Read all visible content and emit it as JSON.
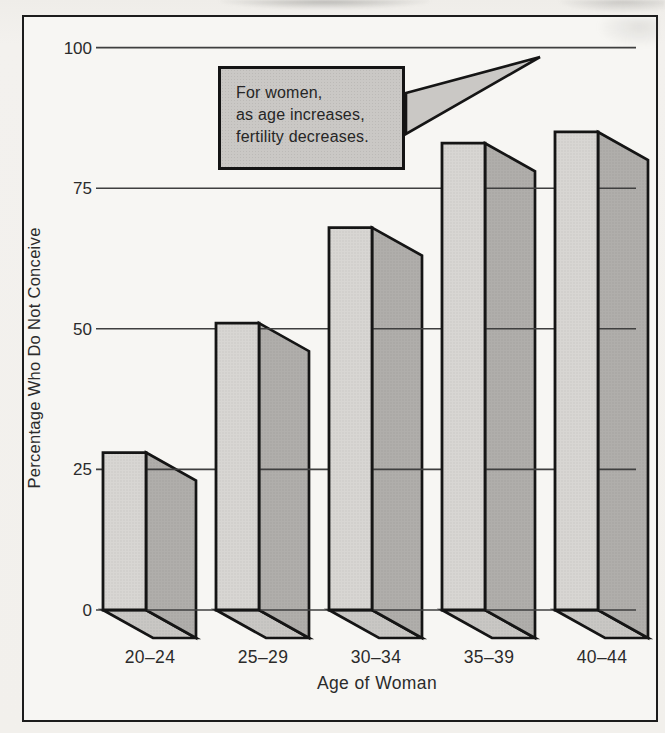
{
  "chart_data": {
    "type": "bar",
    "style": "pseudo-3d-block-bars",
    "title": "",
    "categories": [
      "20–24",
      "25–29",
      "30–34",
      "35–39",
      "40–44"
    ],
    "values": [
      28,
      51,
      68,
      83,
      85
    ],
    "xlabel": "Age of Woman",
    "ylabel": "Percentage Who Do Not Conceive",
    "yticks": [
      0,
      25,
      50,
      75,
      100
    ],
    "ylim": [
      0,
      100
    ],
    "grid": true,
    "legend": null,
    "annotation": {
      "lines": [
        "For women,",
        "as age increases,",
        "fertility decreases."
      ],
      "points_to": "top gridline (100)"
    },
    "colors": {
      "bar_front": "#d8d6d3",
      "bar_side": "#b0aeab",
      "bar_bottom": "#c9c7c4",
      "outline": "#151515",
      "gridline": "#3f3f3f",
      "callout_fill": "#cac8c5",
      "text": "#2b2b2b",
      "frame": "#1c1c1c"
    }
  }
}
